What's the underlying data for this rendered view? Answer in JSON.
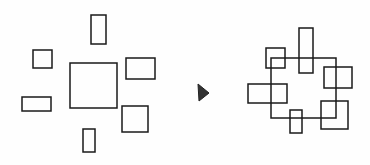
{
  "diagram": {
    "stroke_color": "#1a1a1a",
    "arrow_color": "#333333",
    "before": {
      "center": [
        70,
        63,
        47,
        45
      ],
      "rects": [
        [
          91,
          15,
          15,
          29
        ],
        [
          33,
          50,
          19,
          18
        ],
        [
          126,
          58,
          29,
          21
        ],
        [
          22,
          97,
          29,
          14
        ],
        [
          122,
          106,
          26,
          26
        ],
        [
          83,
          129,
          12,
          23
        ]
      ]
    },
    "after": {
      "center": [
        271,
        58,
        65,
        60
      ],
      "rects": [
        [
          299,
          28,
          14,
          45
        ],
        [
          266,
          48,
          19,
          20
        ],
        [
          324,
          67,
          28,
          21
        ],
        [
          248,
          84,
          39,
          19
        ],
        [
          321,
          101,
          27,
          28
        ],
        [
          290,
          110,
          12,
          23
        ]
      ]
    },
    "arrow": {
      "icon": "triangle-right-icon"
    }
  }
}
